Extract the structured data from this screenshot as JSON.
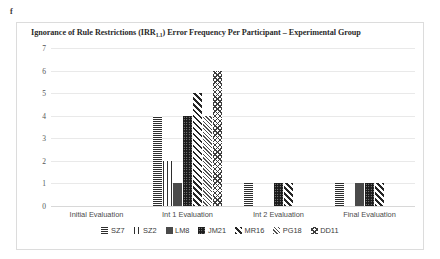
{
  "figure_label": "f",
  "chart_data": {
    "type": "bar",
    "title": "Ignorance of Rule Restrictions (IRR1.1) Error Frequency Per Participant – Experimental Group",
    "title_main_before": "Ignorance of Rule Restrictions (IRR",
    "title_subscript": "1.1",
    "title_main_after": ") Error Frequency Per Participant  –  Experimental Group",
    "xlabel": "",
    "ylabel": "",
    "ylim": [
      0,
      7
    ],
    "yticks": [
      7,
      6,
      5,
      4,
      3,
      2,
      1,
      0
    ],
    "grid": true,
    "legend_position": "bottom",
    "categories": [
      "Initial Evaluation",
      "Int 1 Evaluation",
      "Int 2 Evaluation",
      "Final Evaluation"
    ],
    "series": [
      {
        "name": "SZ7",
        "pattern": "horizontal-lines",
        "values": [
          0,
          4,
          1,
          1
        ]
      },
      {
        "name": "SZ2",
        "pattern": "vertical-lines",
        "values": [
          0,
          2,
          0,
          0
        ]
      },
      {
        "name": "LM8",
        "pattern": "dense-dots",
        "values": [
          0,
          1,
          0,
          1
        ]
      },
      {
        "name": "JM21",
        "pattern": "solid-dark",
        "values": [
          0,
          4,
          1,
          1
        ]
      },
      {
        "name": "MR16",
        "pattern": "diagonal-stripes",
        "values": [
          0,
          5,
          1,
          1
        ]
      },
      {
        "name": "PG18",
        "pattern": "dense-diagonal",
        "values": [
          0,
          4,
          0,
          0
        ]
      },
      {
        "name": "DD11",
        "pattern": "crosshatch",
        "values": [
          0,
          6,
          0,
          0
        ]
      }
    ]
  }
}
